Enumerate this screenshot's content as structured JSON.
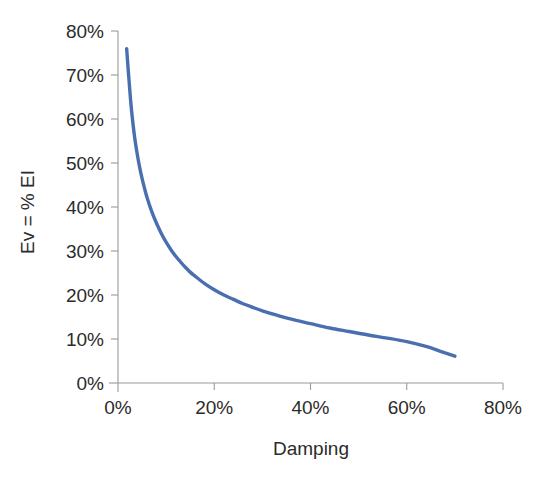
{
  "chart_data": {
    "type": "line",
    "title": "",
    "subtitle": "",
    "xlabel": "Damping",
    "ylabel": "Ev = % EI",
    "xlim": [
      0,
      80
    ],
    "ylim": [
      0,
      80
    ],
    "grid": false,
    "legend": null,
    "legend_position": "none",
    "x_tick_labels": [
      "0%",
      "20%",
      "40%",
      "60%",
      "80%"
    ],
    "x_tick_values": [
      0,
      20,
      40,
      60,
      80
    ],
    "y_tick_labels": [
      "0%",
      "10%",
      "20%",
      "30%",
      "40%",
      "50%",
      "60%",
      "70%",
      "80%"
    ],
    "y_tick_values": [
      0,
      10,
      20,
      30,
      40,
      50,
      60,
      70,
      80
    ],
    "series": [
      {
        "name": "Ev",
        "color": "#4a6fb0",
        "x": [
          1.8,
          2.2,
          2.6,
          3.0,
          3.5,
          4.0,
          4.5,
          5.0,
          5.5,
          6.0,
          7.0,
          8.0,
          9.0,
          10.0,
          11.0,
          12.0,
          13.0,
          14.0,
          15.0,
          16.0,
          18.0,
          20.0,
          22.0,
          24.0,
          26.0,
          28.0,
          30.0,
          33.0,
          36.0,
          40.0,
          44.0,
          48.0,
          52.0,
          56.0,
          60.0,
          64.0,
          67.0,
          70.0
        ],
        "y": [
          76.0,
          70.0,
          64.5,
          60.0,
          55.5,
          52.0,
          49.0,
          46.5,
          44.3,
          42.3,
          39.0,
          36.3,
          34.0,
          32.0,
          30.3,
          28.8,
          27.5,
          26.3,
          25.2,
          24.3,
          22.6,
          21.2,
          20.0,
          19.0,
          18.0,
          17.2,
          16.4,
          15.4,
          14.5,
          13.5,
          12.5,
          11.7,
          10.9,
          10.2,
          9.4,
          8.3,
          7.2,
          6.1
        ]
      }
    ]
  },
  "axes": {
    "x_axis_name": "damping-axis",
    "y_axis_name": "ev-axis"
  },
  "colors": {
    "series": "#4a6fb0",
    "axis": "#9a9a9a",
    "text": "#2b2b2b",
    "background": "#ffffff"
  }
}
